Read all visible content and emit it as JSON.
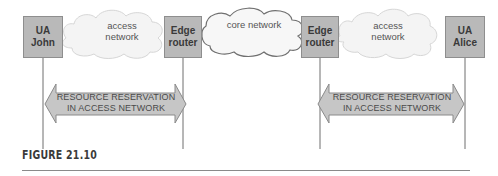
{
  "nodes": {
    "ua_john": {
      "line1": "UA",
      "line2": "John"
    },
    "edge_left": {
      "line1": "Edge",
      "line2": "router"
    },
    "edge_right": {
      "line1": "Edge",
      "line2": "router"
    },
    "ua_alice": {
      "line1": "UA",
      "line2": "Alice"
    }
  },
  "clouds": {
    "access_left": {
      "line1": "access",
      "line2": "network"
    },
    "core": {
      "line1": "core network"
    },
    "access_right": {
      "line1": "access",
      "line2": "network"
    }
  },
  "arrows": {
    "left": {
      "line1": "RESOURCE RESERVATION",
      "line2": "IN ACCESS NETWORK"
    },
    "right": {
      "line1": "RESOURCE RESERVATION",
      "line2": "IN ACCESS NETWORK"
    }
  },
  "caption": {
    "label": "FIGURE 21.10"
  },
  "colors": {
    "box_fill": "#b9b9b9",
    "cloud_fill": "#f4f4f4",
    "arrow_fill": "#c6c6c6",
    "line": "#6e6e6e"
  }
}
